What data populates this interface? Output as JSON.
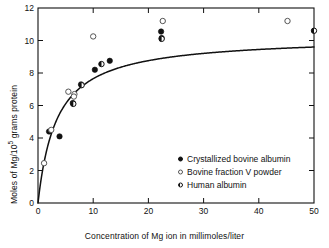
{
  "chart_data": {
    "type": "scatter",
    "title": "",
    "xlabel": "Concentration of Mg ion in millimoles/liter",
    "ylabel": "Moles of Mg/10⁵ grams protein",
    "xlim": [
      0,
      50
    ],
    "ylim": [
      0,
      12
    ],
    "xticks": [
      0,
      10,
      20,
      30,
      40,
      50
    ],
    "yticks": [
      0,
      2,
      4,
      6,
      8,
      10,
      12
    ],
    "grid": false,
    "legend_position": "center",
    "series": [
      {
        "name": "Crystallized bovine albumin",
        "marker": "filled-circle",
        "points": [
          {
            "x": 2.0,
            "y": 4.4
          },
          {
            "x": 3.9,
            "y": 4.1
          },
          {
            "x": 6.3,
            "y": 6.15
          },
          {
            "x": 7.8,
            "y": 7.3
          },
          {
            "x": 10.3,
            "y": 8.2
          },
          {
            "x": 13.0,
            "y": 8.75
          },
          {
            "x": 22.3,
            "y": 10.55
          },
          {
            "x": 22.4,
            "y": 10.15
          }
        ]
      },
      {
        "name": "Bovine fraction V powder",
        "marker": "open-circle",
        "points": [
          {
            "x": 1.1,
            "y": 2.45
          },
          {
            "x": 2.4,
            "y": 4.5
          },
          {
            "x": 5.5,
            "y": 6.85
          },
          {
            "x": 6.6,
            "y": 6.7
          },
          {
            "x": 6.5,
            "y": 6.55
          },
          {
            "x": 10.0,
            "y": 10.25
          },
          {
            "x": 22.6,
            "y": 11.2
          },
          {
            "x": 45.2,
            "y": 11.2
          }
        ]
      },
      {
        "name": "Human albumin",
        "marker": "half-filled-circle",
        "points": [
          {
            "x": 6.4,
            "y": 6.1
          },
          {
            "x": 7.9,
            "y": 7.25
          },
          {
            "x": 11.5,
            "y": 8.55
          },
          {
            "x": 22.4,
            "y": 10.1
          },
          {
            "x": 50.0,
            "y": 10.6
          }
        ]
      }
    ],
    "fit_curve": {
      "name": "saturation-curve",
      "description": "Rectangular hyperbola rising steeply from origin and saturating near 10.2",
      "ymax": 10.25,
      "k": 3.4
    }
  },
  "legend": {
    "items": [
      {
        "label": "Crystallized bovine albumin",
        "marker": "filled-circle"
      },
      {
        "label": "Bovine fraction V powder",
        "marker": "open-circle"
      },
      {
        "label": "Human albumin",
        "marker": "half-filled-circle"
      }
    ]
  }
}
